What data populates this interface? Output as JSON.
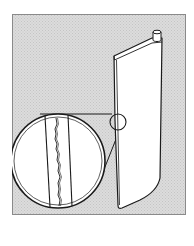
{
  "figure": {
    "description": "Line illustration of a turbine/fan blade with a magnified inset showing a crack",
    "colors": {
      "background": "#ffffff",
      "frame_fill": "#d9d9d9",
      "frame_border": "#8a8a8a",
      "line": "#1a1a1a",
      "blade_fill": "#ffffff"
    },
    "elements": {
      "blade": "turbine-blade",
      "blade_root": "blade-root-cap",
      "detail_marker": "small-circle-marker",
      "magnifier": "magnified-inset",
      "crack": "crack-line"
    }
  }
}
